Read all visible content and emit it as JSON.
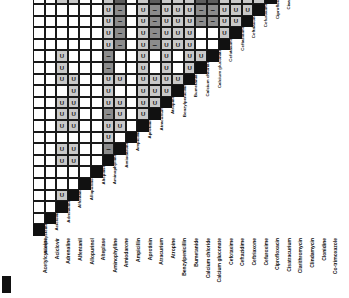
{
  "figure": {
    "type": "drug-compatibility-matrix",
    "shape": "lower-triangular",
    "drug_count": 28
  },
  "legend": {
    "u_symbol": "U",
    "dash_symbol": "–",
    "u_meaning": "U",
    "dash_meaning": "–"
  },
  "colors": {
    "diagonal": "#111111",
    "compatible_light": "#c9c9c9",
    "incompatible_mid": "#8c8c8c",
    "incompatible_dark": "#5e5e5e",
    "empty": "#ffffff",
    "gridline": "#1a1a1a"
  },
  "drugs": [
    "Acetylcysteine",
    "Aciclovir",
    "Adrenaline",
    "Alfentanil",
    "Allopurinol",
    "Alteplase",
    "Aminophylline",
    "Amiodarone",
    "Ampicillin",
    "Aprotinin",
    "Atracurium",
    "Atropine",
    "Benzylpenicillin",
    "Bumetanide",
    "Calcium chloride",
    "Calcium gluconate",
    "Cefotaxime",
    "Ceftazidime",
    "Ceftriaxone",
    "Cefuroxime",
    "Ciprofloxacin",
    "Cisatracurium",
    "Clarithromycin",
    "Clindamycin",
    "Clonidine",
    "Co-trimoxazole"
  ],
  "columns": [
    "Acetylcysteine",
    "Aciclovir",
    "Adrenaline",
    "Alfentanil",
    "Allopurinol",
    "Alteplase",
    "Aminophylline",
    "Amiodarone",
    "Ampicillin",
    "Aprotinin",
    "Atracurium",
    "Atropine",
    "Benzylpenicillin",
    "Bumetanide",
    "Calcium chloride",
    "Calcium gluconate",
    "Cefotaxime",
    "Ceftazidime",
    "Ceftriaxone",
    "Cefuroxime",
    "Ciprofloxacin",
    "Cisatracurium",
    "Clarithromycin",
    "Clindamycin",
    "Clonidine",
    "Co-trimoxazole"
  ],
  "rows": [
    "Acetylcysteine",
    "Aciclovir",
    "Adrenaline",
    "Alfentanil",
    "Allopurinol",
    "Alteplase",
    "Aminophylline",
    "Amiodarone",
    "Ampicillin",
    "Aprotinin",
    "Atracurium",
    "Atropine",
    "Benzylpenicillin",
    "Bumetanide",
    "Calcium chloride",
    "Calcium gluconate",
    "Cefotaxime",
    "Ceftazidime",
    "Ceftriaxone",
    "Cefuroxime",
    "Ciprofloxacin",
    "Cisatracurium",
    "Clarithromycin",
    "Clindamycin",
    "Clonidine",
    "Co-trimoxazole"
  ],
  "cells": [
    [
      "diag"
    ],
    [
      "empty",
      "diag"
    ],
    [
      "empty",
      "empty",
      "diag"
    ],
    [
      "empty",
      "empty",
      "u",
      "diag"
    ],
    [
      "empty",
      "empty",
      "empty",
      "empty",
      "diag"
    ],
    [
      "empty",
      "empty",
      "empty",
      "empty",
      "empty",
      "diag"
    ],
    [
      "empty",
      "empty",
      "u",
      "u",
      "empty",
      "empty",
      "diag"
    ],
    [
      "empty",
      "empty",
      "u",
      "u",
      "empty",
      "empty",
      "d1",
      "diag"
    ],
    [
      "empty",
      "empty",
      "empty",
      "empty",
      "empty",
      "empty",
      "u",
      "empty",
      "diag"
    ],
    [
      "empty",
      "empty",
      "u",
      "u",
      "empty",
      "empty",
      "u",
      "u",
      "empty",
      "diag"
    ],
    [
      "empty",
      "empty",
      "u",
      "u",
      "empty",
      "empty",
      "d1",
      "u",
      "empty",
      "u",
      "diag"
    ],
    [
      "empty",
      "empty",
      "u",
      "u",
      "empty",
      "empty",
      "u",
      "u",
      "empty",
      "u",
      "u",
      "diag"
    ],
    [
      "empty",
      "empty",
      "empty",
      "u",
      "empty",
      "empty",
      "u",
      "empty",
      "empty",
      "u",
      "u",
      "u",
      "diag"
    ],
    [
      "empty",
      "empty",
      "u",
      "u",
      "empty",
      "empty",
      "u",
      "u",
      "empty",
      "u",
      "u",
      "u",
      "u",
      "diag"
    ],
    [
      "empty",
      "empty",
      "u",
      "empty",
      "empty",
      "empty",
      "d1",
      "empty",
      "empty",
      "u",
      "empty",
      "u",
      "empty",
      "u",
      "diag"
    ],
    [
      "empty",
      "empty",
      "u",
      "empty",
      "empty",
      "empty",
      "d1",
      "empty",
      "empty",
      "u",
      "empty",
      "u",
      "empty",
      "u",
      "u",
      "diag"
    ],
    [
      "empty",
      "empty",
      "empty",
      "empty",
      "empty",
      "empty",
      "u",
      "d1",
      "empty",
      "u",
      "d1",
      "u",
      "u",
      "u",
      "empty",
      "empty",
      "diag"
    ],
    [
      "empty",
      "empty",
      "empty",
      "empty",
      "empty",
      "empty",
      "u",
      "d1",
      "empty",
      "u",
      "d1",
      "u",
      "u",
      "u",
      "empty",
      "empty",
      "u",
      "diag"
    ],
    [
      "empty",
      "empty",
      "empty",
      "empty",
      "empty",
      "empty",
      "u",
      "d1",
      "empty",
      "u",
      "d1",
      "u",
      "u",
      "u",
      "d1",
      "d1",
      "u",
      "u",
      "diag"
    ],
    [
      "empty",
      "empty",
      "empty",
      "empty",
      "empty",
      "empty",
      "u",
      "d1",
      "empty",
      "u",
      "d1",
      "u",
      "u",
      "u",
      "d1",
      "d1",
      "u",
      "u",
      "u",
      "diag"
    ],
    [
      "empty",
      "empty",
      "u",
      "u",
      "empty",
      "empty",
      "u",
      "d2",
      "empty",
      "u",
      "d2",
      "u",
      "u",
      "u",
      "d2",
      "d2",
      "u",
      "u",
      "u",
      "u",
      "diag"
    ],
    [
      "empty",
      "empty",
      "u",
      "u",
      "empty",
      "empty",
      "u",
      "u",
      "empty",
      "u",
      "u",
      "u",
      "u",
      "u",
      "d1",
      "d1",
      "u",
      "u",
      "u",
      "u",
      "u",
      "diag"
    ],
    [
      "empty",
      "empty",
      "empty",
      "empty",
      "empty",
      "empty",
      "u",
      "empty",
      "empty",
      "empty",
      "empty",
      "empty",
      "empty",
      "empty",
      "empty",
      "empty",
      "empty",
      "empty",
      "u",
      "u",
      "u",
      "u",
      "diag"
    ],
    [
      "empty",
      "empty",
      "empty",
      "empty",
      "empty",
      "empty",
      "u",
      "empty",
      "empty",
      "empty",
      "empty",
      "empty",
      "empty",
      "empty",
      "empty",
      "empty",
      "empty",
      "empty",
      "u",
      "u",
      "u",
      "u",
      "u",
      "diag"
    ],
    [
      "empty",
      "empty",
      "u",
      "u",
      "empty",
      "empty",
      "u",
      "u",
      "empty",
      "u",
      "u",
      "u",
      "u",
      "u",
      "empty",
      "empty",
      "u",
      "u",
      "u",
      "u",
      "u",
      "u",
      "u",
      "u",
      "diag"
    ],
    [
      "empty",
      "empty",
      "empty",
      "empty",
      "empty",
      "empty",
      "u",
      "empty",
      "empty",
      "empty",
      "d1",
      "empty",
      "empty",
      "empty",
      "empty",
      "empty",
      "empty",
      "empty",
      "empty",
      "empty",
      "u",
      "u",
      "empty",
      "empty",
      "u",
      "diag"
    ]
  ],
  "geometry": {
    "cell_size": 11.6,
    "origin_x": 33,
    "bottom_y": 236,
    "label_gap": 2
  },
  "corner_mark": {
    "x": 2,
    "y": 276,
    "width": 9,
    "height": 17
  }
}
